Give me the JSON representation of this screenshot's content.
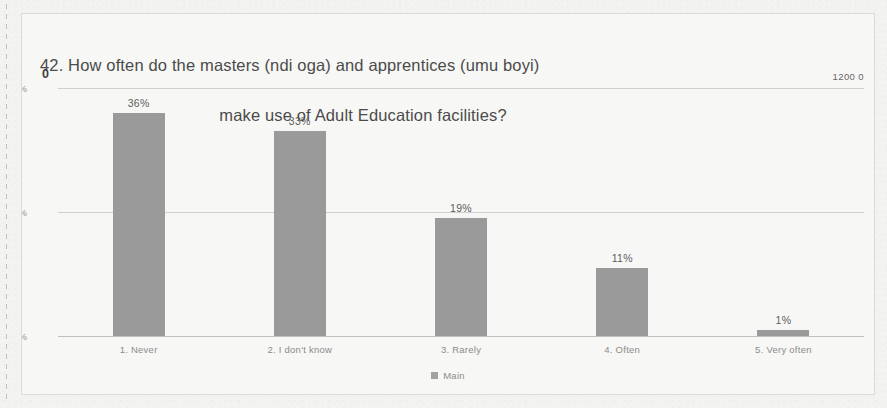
{
  "chart_data": {
    "type": "bar",
    "title": "42. How often do the masters (ndi oga) and apprentices (umu boyi) make use of Adult Education facilities?",
    "title_line_1": "42. How often do the masters (ndi oga) and apprentices (umu boyi)",
    "title_line_2": "make use of Adult Education facilities?",
    "xlabel": "",
    "ylabel": "",
    "categories": [
      "1. Never",
      "2. I don't know",
      "3. Rarely",
      "4. Often",
      "5. Very often"
    ],
    "values": [
      36,
      33,
      19,
      11,
      1
    ],
    "value_labels": [
      "36%",
      "33%",
      "19%",
      "11%",
      "1%"
    ],
    "series": [
      {
        "name": "Main",
        "values": [
          36,
          33,
          19,
          11,
          1
        ]
      }
    ],
    "ylim": [
      0,
      40
    ],
    "y_tick_labels": [
      "0%",
      "0%",
      "0%"
    ],
    "y_tick_values": [
      40,
      20,
      0
    ],
    "grid": true,
    "legend_position": "bottom",
    "bar_color": "#9a9a9a",
    "background_color": "#f7f7f5",
    "text_color": "#8c8c8c"
  },
  "markers": {
    "left": "0",
    "right": "1200 0"
  },
  "legend": {
    "label": "Main",
    "marker_icon": "square-swatch-icon"
  }
}
